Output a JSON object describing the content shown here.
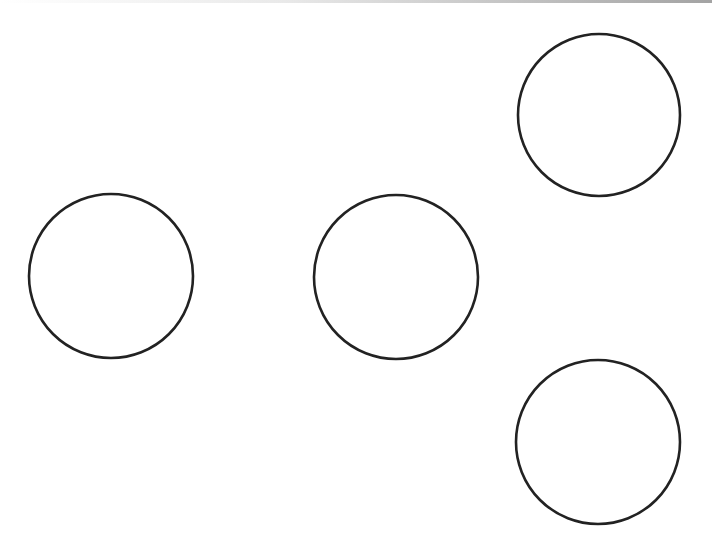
{
  "diagram": {
    "width": 712,
    "height": 550,
    "background": "#ffffff",
    "stroke_color": "#222222",
    "stroke_width": 2.6,
    "shapes": [
      {
        "name": "circle-top-right",
        "type": "circle",
        "cx": 599,
        "cy": 115,
        "r": 81
      },
      {
        "name": "circle-left",
        "type": "circle",
        "cx": 111,
        "cy": 276,
        "r": 82
      },
      {
        "name": "circle-middle",
        "type": "circle",
        "cx": 396,
        "cy": 277,
        "r": 82
      },
      {
        "name": "circle-bottom-right",
        "type": "circle",
        "cx": 598,
        "cy": 442,
        "r": 82
      }
    ]
  }
}
